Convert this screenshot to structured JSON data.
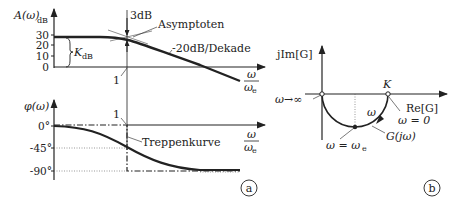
{
  "diagram_a": {
    "label": "a",
    "amplitude_plot": {
      "ylabel": "A(ω)",
      "ylabel_sub": "dB",
      "yticks": [
        "30",
        "20",
        "10",
        "0"
      ],
      "gain_label": "K",
      "gain_label_sub": "dB",
      "corner_label": "1",
      "annotation_3db": "3dB",
      "annotation_asymptotes": "Asymptoten",
      "annotation_slope": "-20dB/Dekade",
      "xlabel_num": "ω",
      "xlabel_den": "ω",
      "xlabel_den_sub": "e"
    },
    "phase_plot": {
      "ylabel": "φ(ω)",
      "yticks": [
        "0°",
        "-45°",
        "-90°"
      ],
      "corner_label": "1",
      "annotation_step": "Treppenkurve",
      "xlabel_num": "ω",
      "xlabel_den": "ω",
      "xlabel_den_sub": "e"
    }
  },
  "diagram_b": {
    "label": "b",
    "ylabel": "jIm[G]",
    "xlabel": "Re[G]",
    "point_K": "K",
    "omega_zero": "ω = 0",
    "omega_inf": "ω→∞",
    "omega_arrow": "ω",
    "omega_e": "ω = ω",
    "omega_e_sub": "e",
    "curve_label": "G(jω)"
  }
}
